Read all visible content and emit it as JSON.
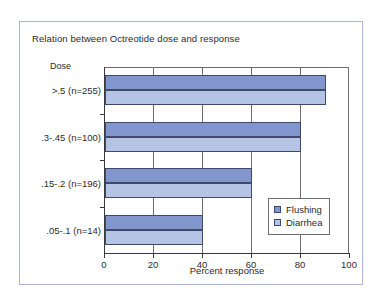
{
  "chart_data": {
    "type": "bar",
    "orientation": "horizontal",
    "title": "Relation between Octreotide dose and response",
    "xlabel": "Percent response",
    "ylabel": "Dose",
    "categories": [
      ">.5 (n=255)",
      ".3-.45 (n=100)",
      ".15-.2 (n=196)",
      ".05-.1 (n=14)"
    ],
    "series": [
      {
        "name": "Flushing",
        "values": [
          90,
          80,
          60,
          40
        ],
        "color": "#8096cc"
      },
      {
        "name": "Diarrhea",
        "values": [
          90,
          80,
          60,
          40
        ],
        "color": "#b5c4e4"
      }
    ],
    "xlim": [
      0,
      100
    ],
    "xticks": [
      0,
      20,
      40,
      60,
      80,
      100
    ],
    "xticklabels": [
      "0",
      "20",
      "40",
      "60",
      "80",
      "100"
    ],
    "grid": "vertical",
    "legend_position": "center-right",
    "frame_border_color": "#aab6d4",
    "axis_color": "#3a3a3a"
  },
  "legend": {
    "items": [
      {
        "label": "Flushing",
        "swatch": "legend-swatch-flushing"
      },
      {
        "label": "Diarrhea",
        "swatch": "legend-swatch-diarrhea"
      }
    ]
  }
}
